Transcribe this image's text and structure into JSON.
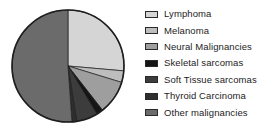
{
  "chart_data": {
    "type": "pie",
    "title": "",
    "subtitle": "",
    "xlabel": "",
    "ylabel": "",
    "grid": false,
    "legend_position": "right",
    "start_angle_deg": 0,
    "direction": "clockwise",
    "categories": [
      "Lymphoma",
      "Melanoma",
      "Neural Malignancies",
      "Skeletal sarcomas",
      "Soft Tissue sarcomas",
      "Thyroid Carcinoma",
      "Other malignancies"
    ],
    "values": [
      26.4,
      3.3,
      9.7,
      1.9,
      6.1,
      1.4,
      51.2
    ],
    "units": "percent",
    "slice_angles_deg": [
      95,
      12,
      35,
      7,
      22,
      5,
      184
    ],
    "colors": [
      "#d5d5d5",
      "#bdbdbd",
      "#9e9e9e",
      "#151515",
      "#3c3c3c",
      "#2e2e2e",
      "#6b6b6b"
    ],
    "outline_color": "#1e1e1e",
    "series": [
      {
        "name": "Malignancy distribution",
        "values": [
          26.4,
          3.3,
          9.7,
          1.9,
          6.1,
          1.4,
          51.2
        ]
      }
    ]
  },
  "legend": {
    "items": [
      {
        "label": "Lymphoma",
        "swatch_name": "legend-swatch-lymphoma",
        "color": "#d5d5d5"
      },
      {
        "label": "Melanoma",
        "swatch_name": "legend-swatch-melanoma",
        "color": "#bdbdbd"
      },
      {
        "label": "Neural Malignancies",
        "swatch_name": "legend-swatch-neural-malignancies",
        "color": "#9e9e9e"
      },
      {
        "label": "Skeletal sarcomas",
        "swatch_name": "legend-swatch-skeletal-sarcomas",
        "color": "#151515"
      },
      {
        "label": "Soft Tissue sarcomas",
        "swatch_name": "legend-swatch-soft-tissue-sarcomas",
        "color": "#3c3c3c"
      },
      {
        "label": "Thyroid Carcinoma",
        "swatch_name": "legend-swatch-thyroid-carcinoma",
        "color": "#2e2e2e"
      },
      {
        "label": "Other malignancies",
        "swatch_name": "legend-swatch-other-malignancies",
        "color": "#6b6b6b"
      }
    ]
  }
}
